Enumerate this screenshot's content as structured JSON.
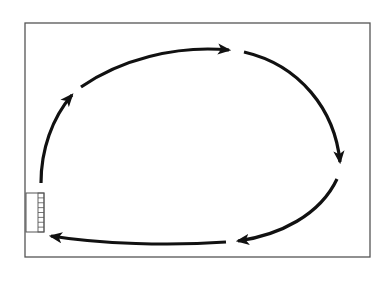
{
  "diagram": {
    "description": "Rectangular room outline with a circular flow of five curved arrows running clockwise, starting and ending at a small gridded box on the lower-left wall",
    "colors": {
      "background": "#ffffff",
      "frame": "#555555",
      "arrow": "#111111"
    },
    "frame": {
      "x": 25,
      "y": 23,
      "width": 345,
      "height": 234
    },
    "station_box": {
      "x": 26,
      "y": 193,
      "width": 18,
      "height": 39,
      "grid_cells": 8
    },
    "arrows": [
      {
        "id": "up-left",
        "path": "M41,183 C41,150 52,118 72,95"
      },
      {
        "id": "top-left",
        "path": "M81,87 C120,60 175,45 229,50"
      },
      {
        "id": "top-right",
        "path": "M244,52 C300,65 335,110 340,162"
      },
      {
        "id": "right-bottom",
        "path": "M337,179 C320,215 280,235 238,241"
      },
      {
        "id": "bottom",
        "path": "M226,242 C170,246 100,244 51,236"
      }
    ]
  }
}
